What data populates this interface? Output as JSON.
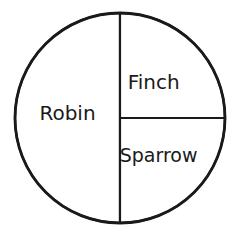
{
  "chart_data": {
    "type": "pie",
    "title": "",
    "categories": [
      "Robin",
      "Sparrow",
      "Finch"
    ],
    "values": [
      50,
      25,
      25
    ],
    "value_unit": "percent",
    "labels_inside": true,
    "legend": "none",
    "colors": {
      "fill": "#ffffff",
      "stroke": "#1a1a1a",
      "text": "#1a1a1a"
    }
  }
}
